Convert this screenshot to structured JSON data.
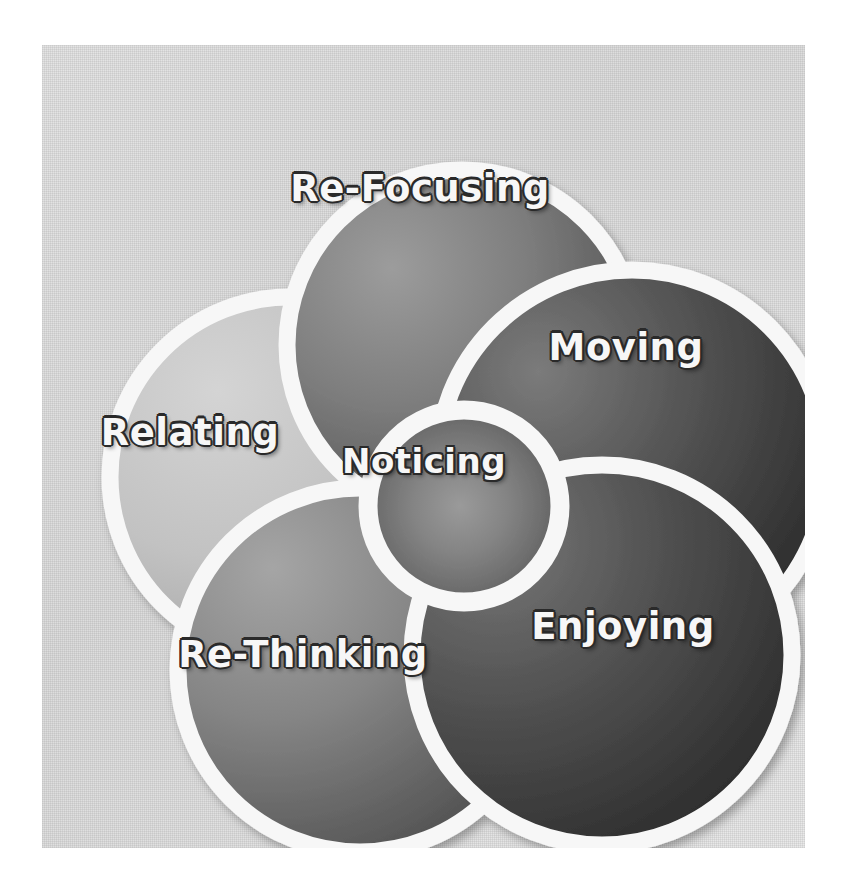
{
  "diagram": {
    "type": "petal-venn",
    "background_color": "#e2e2e2",
    "ring_color": "#f7f7f7",
    "label_text_color": "#f7f7f7",
    "label_outline_color": "#2a2a2a",
    "center": {
      "id": "noticing",
      "label": "Noticing",
      "cx": 422,
      "cy": 461,
      "r": 96,
      "fill_light": "#8f8f8f",
      "fill_dark": "#4e4e4e"
    },
    "petals": [
      {
        "id": "re-focusing",
        "label": "Re-Focusing",
        "cx": 420,
        "cy": 300,
        "r": 175,
        "fill_light": "#8a8a8a",
        "fill_dark": "#4a4a4a",
        "label_x": 420,
        "label_y": 188
      },
      {
        "id": "moving",
        "label": "Moving",
        "cx": 590,
        "cy": 420,
        "r": 195,
        "fill_light": "#6b6b6b",
        "fill_dark": "#2e2e2e",
        "label_x": 626,
        "label_y": 347
      },
      {
        "id": "enjoying",
        "label": "Enjoying",
        "cx": 560,
        "cy": 610,
        "r": 190,
        "fill_light": "#6a6a6a",
        "fill_dark": "#303030",
        "label_x": 623,
        "label_y": 626
      },
      {
        "id": "re-thinking",
        "label": "Re-Thinking",
        "cx": 318,
        "cy": 625,
        "r": 182,
        "fill_light": "#939393",
        "fill_dark": "#525252",
        "label_x": 303,
        "label_y": 654
      },
      {
        "id": "relating",
        "label": "Relating",
        "cx": 248,
        "cy": 432,
        "r": 180,
        "fill_light": "#c9c9c9",
        "fill_dark": "#a3a3a3",
        "label_x": 190,
        "label_y": 432
      }
    ]
  }
}
